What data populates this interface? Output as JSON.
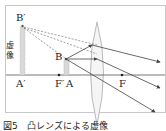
{
  "figure": {
    "caption": "図5　凸レンズによる虚像",
    "labels": {
      "virtual_image_top": "B′",
      "virtual_image_bottom": "A′",
      "virtual_image_text": "虚像",
      "object_top": "B",
      "object_bottom": "A",
      "focal_left": "F′",
      "focal_right": "F"
    },
    "colors": {
      "frame": "#c8c8c8",
      "axis": "#555555",
      "ray": "#444444",
      "dashed_ray": "#777777",
      "virtual_image_fill": "#d9d9d9",
      "object_fill": "#d9d9d9",
      "lens_stroke": "#aaaaaa",
      "lens_fill": "#f5f5f5"
    },
    "geometry": {
      "axis_y": 75,
      "virtual_image_x": 22,
      "virtual_image_top_y": 25,
      "object_x": 66,
      "object_top_y": 58,
      "lens_x": 97,
      "focal_left_x": 59,
      "focal_right_x": 122
    }
  }
}
